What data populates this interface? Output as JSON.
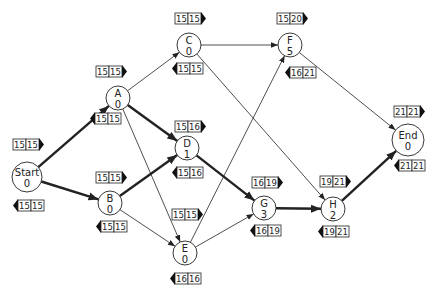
{
  "diagram": {
    "colors": {
      "line": "#222222",
      "background": "#ffffff"
    },
    "nodes": [
      {
        "id": "Start",
        "label": "Start",
        "duration": "0",
        "x": 27,
        "y": 177,
        "r": 15,
        "top": {
          "a": "15",
          "b": "15",
          "x": 13,
          "y": 139
        },
        "bottom": {
          "a": "15",
          "b": "15",
          "x": 13,
          "y": 200
        }
      },
      {
        "id": "A",
        "label": "A",
        "duration": "0",
        "x": 118,
        "y": 98,
        "r": 12,
        "top": {
          "a": "15",
          "b": "15",
          "x": 96,
          "y": 66
        },
        "bottom": {
          "a": "15",
          "b": "15",
          "x": 90,
          "y": 113
        }
      },
      {
        "id": "B",
        "label": "B",
        "duration": "0",
        "x": 110,
        "y": 203,
        "r": 12,
        "top": {
          "a": "15",
          "b": "15",
          "x": 96,
          "y": 172
        },
        "bottom": {
          "a": "15",
          "b": "15",
          "x": 96,
          "y": 221
        }
      },
      {
        "id": "C",
        "label": "C",
        "duration": "0",
        "x": 189,
        "y": 45,
        "r": 12,
        "top": {
          "a": "15",
          "b": "15",
          "x": 175,
          "y": 13
        },
        "bottom": {
          "a": "15",
          "b": "15",
          "x": 172,
          "y": 63
        }
      },
      {
        "id": "D",
        "label": "D",
        "duration": "1",
        "x": 187,
        "y": 148,
        "r": 12,
        "top": {
          "a": "15",
          "b": "16",
          "x": 175,
          "y": 121
        },
        "bottom": {
          "a": "15",
          "b": "16",
          "x": 172,
          "y": 167
        }
      },
      {
        "id": "E",
        "label": "E",
        "duration": "0",
        "x": 185,
        "y": 253,
        "r": 12,
        "top": {
          "a": "15",
          "b": "15",
          "x": 172,
          "y": 209
        },
        "bottom": {
          "a": "16",
          "b": "16",
          "x": 170,
          "y": 273
        }
      },
      {
        "id": "F",
        "label": "F",
        "duration": "5",
        "x": 290,
        "y": 45,
        "r": 12,
        "top": {
          "a": "15",
          "b": "20",
          "x": 277,
          "y": 13
        },
        "bottom": {
          "a": "16",
          "b": "21",
          "x": 285,
          "y": 67
        }
      },
      {
        "id": "G",
        "label": "G",
        "duration": "3",
        "x": 264,
        "y": 208,
        "r": 12,
        "top": {
          "a": "16",
          "b": "19",
          "x": 252,
          "y": 177
        },
        "bottom": {
          "a": "16",
          "b": "19",
          "x": 250,
          "y": 225
        }
      },
      {
        "id": "H",
        "label": "H",
        "duration": "2",
        "x": 333,
        "y": 209,
        "r": 12,
        "top": {
          "a": "19",
          "b": "21",
          "x": 320,
          "y": 176
        },
        "bottom": {
          "a": "19",
          "b": "21",
          "x": 318,
          "y": 226
        }
      },
      {
        "id": "End",
        "label": "End",
        "duration": "0",
        "x": 408,
        "y": 140,
        "r": 16,
        "top": {
          "a": "21",
          "b": "21",
          "x": 394,
          "y": 106
        },
        "bottom": {
          "a": "21",
          "b": "21",
          "x": 394,
          "y": 160
        }
      }
    ],
    "edges": [
      {
        "from": "Start",
        "to": "A",
        "critical": true
      },
      {
        "from": "Start",
        "to": "B",
        "critical": true
      },
      {
        "from": "A",
        "to": "C",
        "critical": false
      },
      {
        "from": "A",
        "to": "D",
        "critical": true
      },
      {
        "from": "A",
        "to": "E",
        "critical": false
      },
      {
        "from": "B",
        "to": "D",
        "critical": true
      },
      {
        "from": "B",
        "to": "E",
        "critical": false
      },
      {
        "from": "C",
        "to": "F",
        "critical": false
      },
      {
        "from": "C",
        "to": "H",
        "critical": false
      },
      {
        "from": "D",
        "to": "G",
        "critical": true
      },
      {
        "from": "E",
        "to": "F",
        "critical": false
      },
      {
        "from": "E",
        "to": "G",
        "critical": false
      },
      {
        "from": "F",
        "to": "End",
        "critical": false
      },
      {
        "from": "G",
        "to": "H",
        "critical": true
      },
      {
        "from": "H",
        "to": "End",
        "critical": true
      }
    ]
  }
}
